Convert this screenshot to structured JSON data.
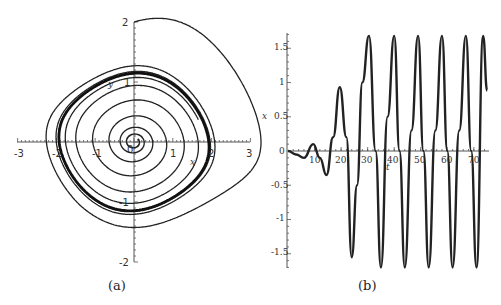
{
  "chart_data": [
    {
      "id": "a",
      "type": "line",
      "title": "",
      "caption": "(a)",
      "xlabel": "x",
      "ylabel": "y",
      "xlim": [
        -3,
        3
      ],
      "ylim": [
        -2,
        2
      ],
      "xticks": [
        "-3",
        "-2",
        "-1",
        "0",
        "1",
        "2",
        "3"
      ],
      "yticks": [
        "2",
        "1",
        "0",
        "-1",
        "-2"
      ],
      "grid": false,
      "description": "Phase portrait: two trajectories converging to a stable limit cycle",
      "series": [
        {
          "name": "trajectory from (0, 2)",
          "start": [
            0,
            2
          ],
          "style": "thin",
          "points": [
            [
              0,
              2
            ],
            [
              0.6,
              1.5
            ],
            [
              1.2,
              0.9
            ],
            [
              1.8,
              0.3
            ],
            [
              2.0,
              0
            ],
            [
              1.9,
              -0.5
            ],
            [
              1.4,
              -1.05
            ],
            [
              0.5,
              -1.3
            ],
            [
              -0.2,
              -1.2
            ],
            [
              -1.0,
              -1.0
            ],
            [
              -1.6,
              -0.6
            ],
            [
              -1.9,
              0
            ],
            [
              -1.8,
              0.5
            ],
            [
              -1.3,
              0.95
            ],
            [
              -0.5,
              1.15
            ],
            [
              0.2,
              1.1
            ],
            [
              1.0,
              0.8
            ],
            [
              1.6,
              0.3
            ],
            [
              1.9,
              0
            ]
          ]
        },
        {
          "name": "trajectory from near origin",
          "start": [
            0.1,
            0.05
          ],
          "style": "thin",
          "points": [
            [
              0.1,
              0.05
            ],
            [
              0.15,
              0.1
            ],
            [
              0,
              0.15
            ],
            [
              -0.1,
              0.05
            ],
            [
              -0.05,
              -0.1
            ],
            [
              0.1,
              -0.05
            ],
            [
              0.3,
              0.2
            ],
            [
              0.1,
              0.45
            ],
            [
              -0.3,
              0.3
            ],
            [
              -0.4,
              0
            ],
            [
              -0.2,
              -0.2
            ],
            [
              0.3,
              0.5
            ],
            [
              0.9,
              0.3
            ],
            [
              0.95,
              0
            ],
            [
              0.6,
              -0.5
            ],
            [
              0,
              -0.75
            ],
            [
              -0.9,
              -0.6
            ],
            [
              -1.5,
              -0.1
            ],
            [
              -1.5,
              0.5
            ],
            [
              -0.9,
              0.95
            ],
            [
              0,
              1.0
            ],
            [
              0.9,
              0.7
            ],
            [
              1.6,
              0.1
            ]
          ]
        },
        {
          "name": "limit cycle",
          "style": "thick",
          "points": [
            [
              1.9,
              0
            ],
            [
              1.7,
              -0.5
            ],
            [
              1.2,
              -1.0
            ],
            [
              0.4,
              -1.25
            ],
            [
              -0.5,
              -1.15
            ],
            [
              -1.4,
              -0.7
            ],
            [
              -1.85,
              -0.1
            ],
            [
              -1.8,
              0.5
            ],
            [
              -1.3,
              1.0
            ],
            [
              -0.4,
              1.15
            ],
            [
              0.4,
              1.05
            ],
            [
              1.2,
              0.7
            ],
            [
              1.7,
              0.25
            ],
            [
              1.9,
              0
            ]
          ]
        }
      ]
    },
    {
      "id": "b",
      "type": "line",
      "title": "",
      "caption": "(b)",
      "xlabel": "t",
      "ylabel": "x",
      "xlim": [
        0,
        75
      ],
      "ylim": [
        -1.7,
        1.7
      ],
      "xticks": [
        "10",
        "20",
        "30",
        "40",
        "50",
        "60",
        "70"
      ],
      "yticks": [
        "1.5",
        "1",
        "0.5",
        "0",
        "-0.5",
        "-1",
        "-1.5"
      ],
      "grid": false,
      "description": "Time series x(t) growing from near zero to steady oscillation of amplitude ~1.7, period ~9.2",
      "series": [
        {
          "name": "x(t)",
          "x": [
            0,
            3,
            6,
            9.5,
            12,
            14.5,
            17,
            19.5,
            22,
            24,
            26,
            28,
            30.5,
            33,
            35,
            37.5,
            40,
            42,
            44,
            46.5,
            49,
            51,
            53,
            55.5,
            58,
            60,
            62,
            64.5,
            67,
            69,
            71,
            73.5,
            75
          ],
          "values": [
            0,
            -0.05,
            -0.1,
            0.1,
            -0.1,
            -0.35,
            0.2,
            0.93,
            0.2,
            -1.55,
            -0.5,
            1.0,
            1.68,
            0,
            -1.7,
            0.5,
            1.68,
            0,
            -1.7,
            0.3,
            1.68,
            0,
            -1.7,
            0.3,
            1.68,
            0,
            -1.7,
            0.3,
            1.68,
            0,
            -1.7,
            1.68,
            0.88
          ]
        }
      ]
    }
  ],
  "sim": {
    "mu": 0.2,
    "growth_b": {
      "x0": 0.01,
      "v0": 0.01
    }
  }
}
